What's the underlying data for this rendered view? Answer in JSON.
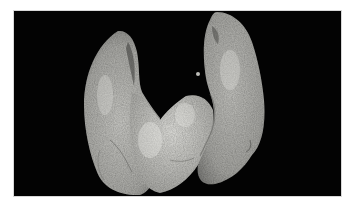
{
  "image": {
    "subject": "thyroid-gland-specimen",
    "background_color": "#030303",
    "page_color": "#ffffff",
    "tissue_colors": {
      "light": "#d6d6d2",
      "mid": "#a9a9a5",
      "dark": "#6f6f6c",
      "shadow": "#3a3a38"
    }
  }
}
